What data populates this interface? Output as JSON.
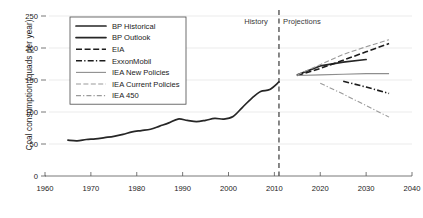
{
  "chart_data": {
    "type": "line",
    "title": "",
    "xlabel": "",
    "ylabel": "Coal consumption (quads per year)",
    "xlim": [
      1960,
      2040
    ],
    "ylim": [
      0,
      250
    ],
    "xticks": [
      1960,
      1970,
      1980,
      1990,
      2000,
      2010,
      2020,
      2030,
      2040
    ],
    "yticks": [
      0,
      50,
      100,
      150,
      200,
      250
    ],
    "grid": true,
    "legend_position": "upper-left",
    "annotations": [
      {
        "text": "History",
        "x": 2006,
        "y": 238
      },
      {
        "text": "Projections",
        "x": 2016,
        "y": 238
      }
    ],
    "divider_year": 2011,
    "series": [
      {
        "name": "BP Historical",
        "style": "solid",
        "color": "#262626",
        "x": [
          1965,
          1967,
          1969,
          1971,
          1973,
          1975,
          1977,
          1979,
          1981,
          1983,
          1985,
          1987,
          1989,
          1991,
          1993,
          1995,
          1997,
          1999,
          2001,
          2003,
          2005,
          2007,
          2009,
          2011
        ],
        "values": [
          56,
          55,
          57,
          58,
          60,
          62,
          65,
          69,
          71,
          73,
          78,
          83,
          89,
          87,
          85,
          87,
          90,
          89,
          93,
          107,
          121,
          132,
          135,
          147
        ]
      },
      {
        "name": "BP Outlook",
        "style": "solid",
        "color": "#262626",
        "x": [
          2015,
          2020,
          2025,
          2030
        ],
        "values": [
          158,
          172,
          178,
          182
        ]
      },
      {
        "name": "EIA",
        "style": "dashed",
        "color": "#1c1c1c",
        "x": [
          2015,
          2020,
          2025,
          2030,
          2035
        ],
        "values": [
          157,
          168,
          181,
          194,
          207
        ]
      },
      {
        "name": "ExxonMobil",
        "style": "dash-dot",
        "color": "#1c1c1c",
        "x": [
          2025,
          2030,
          2035
        ],
        "values": [
          148,
          139,
          129
        ]
      },
      {
        "name": "IEA New Policies",
        "style": "solid-thin",
        "color": "#8e8e8e",
        "x": [
          2015,
          2020,
          2025,
          2030,
          2035
        ],
        "values": [
          157,
          158,
          159,
          160,
          160
        ]
      },
      {
        "name": "IEA Current Policies",
        "style": "dashed-thin",
        "color": "#9a9a9a",
        "x": [
          2015,
          2020,
          2025,
          2030,
          2035
        ],
        "values": [
          158,
          174,
          190,
          202,
          213
        ]
      },
      {
        "name": "IEA 450",
        "style": "dash-dot-thin",
        "color": "#9a9a9a",
        "x": [
          2020,
          2025,
          2030,
          2035
        ],
        "values": [
          145,
          128,
          110,
          92
        ]
      }
    ]
  },
  "legend": {
    "items": [
      {
        "label": "BP Historical"
      },
      {
        "label": "BP Outlook"
      },
      {
        "label": "EIA"
      },
      {
        "label": "ExxonMobil"
      },
      {
        "label": "IEA New Policies"
      },
      {
        "label": "IEA Current Policies"
      },
      {
        "label": "IEA 450"
      }
    ]
  }
}
